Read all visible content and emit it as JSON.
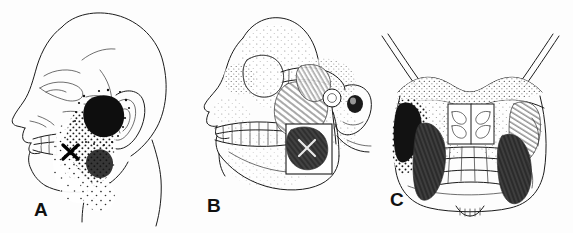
{
  "figure": {
    "caption_partial": "",
    "background_color": "#fdfdfd",
    "ink_color": "#1b1b1b",
    "panels": [
      {
        "id": "A",
        "label": "A",
        "view": "lateral head, soft-tissue profile with skull and teeth visible",
        "content": "Referred pain pattern of the superficial masseter shown as stippling over the cheek, mandible and into the ear; solid black essential zone anterior to the ear; X marks the trigger point.",
        "markers": [
          {
            "name": "trigger-point-x",
            "symbol": "X",
            "x": 70,
            "y": 152
          },
          {
            "name": "essential-pain-zone",
            "symbol": "solid-black-patch"
          },
          {
            "name": "spillover-pain-zone",
            "symbol": "stipple"
          }
        ]
      },
      {
        "id": "B",
        "label": "B",
        "view": "lateral skull with stippled bone shading, zygomatic arch and mandible",
        "content": "Superficial masseter shown with diagonal striations attaching from zygomatic arch to mandibular angle; deep masseter exposed in a cut-away window as a dark muscle containing trigger points; temporomandibular joint and external ear shown posteriorly.",
        "muscles": [
          {
            "name": "superficial-masseter",
            "shading": "diagonal-striation"
          },
          {
            "name": "deep-masseter",
            "shading": "solid-dark"
          }
        ]
      },
      {
        "id": "C",
        "label": "C",
        "view": "coronal (frontal) skull, anterior view",
        "content": "Bilateral masseter muscles seen from the front; left side dark with stippled referred pain over the cheek and maxilla, right side shown with striated muscle fibers; nasal turbinates and maxillary teeth visible in the midline; zygomatic arches flare laterally.",
        "muscles": [
          {
            "name": "masseter-left",
            "shading": "solid-dark"
          },
          {
            "name": "masseter-right",
            "shading": "striation"
          }
        ],
        "structures": [
          "zygomatic-arch",
          "orbital-rim",
          "nasal-turbinates",
          "maxillary-teeth",
          "mandible"
        ]
      }
    ]
  }
}
